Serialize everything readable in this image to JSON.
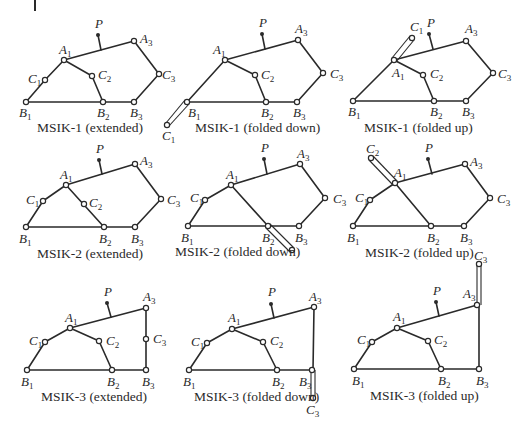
{
  "figure": {
    "rows": [
      {
        "mechanism": "MSIK-1",
        "panels": [
          {
            "caption": "MSIK-1 (extended)",
            "state": "extended"
          },
          {
            "caption": "MSIK-1 (folded down)",
            "state": "folded down"
          },
          {
            "caption": "MSIK-1 (folded up)",
            "state": "folded up"
          }
        ]
      },
      {
        "mechanism": "MSIK-2",
        "panels": [
          {
            "caption": "MSIK-2 (extended)",
            "state": "extended"
          },
          {
            "caption": "MSIK-2 (folded down)",
            "state": "folded down"
          },
          {
            "caption": "MSIK-2 (folded up)",
            "state": "folded up"
          }
        ]
      },
      {
        "mechanism": "MSIK-3",
        "panels": [
          {
            "caption": "MSIK-3 (extended)",
            "state": "extended"
          },
          {
            "caption": "MSIK-3 (folded down)",
            "state": "folded down"
          },
          {
            "caption": "MSIK-3 (folded up)",
            "state": "folded up"
          }
        ]
      }
    ],
    "joint_labels": {
      "A1": "A",
      "A1_sub": "1",
      "A3": "A",
      "A3_sub": "3",
      "B1": "B",
      "B1_sub": "1",
      "B2": "B",
      "B2_sub": "2",
      "B3": "B",
      "B3_sub": "3",
      "C1": "C",
      "C1_sub": "1",
      "C2": "C",
      "C2_sub": "2",
      "C3": "C",
      "C3_sub": "3",
      "P": "P"
    }
  }
}
